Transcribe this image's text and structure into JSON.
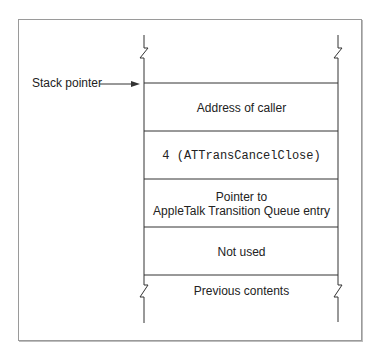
{
  "diagram": {
    "title": "",
    "pointer_label": "Stack pointer",
    "cells": [
      {
        "label": "Address of caller",
        "mono": false
      },
      {
        "label": "4 (ATTransCancelClose)",
        "mono": true
      },
      {
        "label_line1": "Pointer to",
        "label_line2": "AppleTalk Transition Queue entry",
        "mono": false
      },
      {
        "label": "Not used",
        "mono": false
      }
    ],
    "bottom_label": "Previous contents",
    "colors": {
      "line": "#333333",
      "frame": "#9a9a9a"
    }
  }
}
